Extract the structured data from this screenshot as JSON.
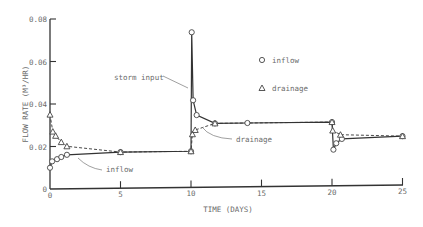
{
  "chart_data": {
    "type": "line",
    "title": "",
    "xlabel": "TIME (DAYS)",
    "ylabel": "FLOW RATE (M³/HR)",
    "xlim": [
      0,
      25
    ],
    "ylim": [
      0,
      0.08
    ],
    "x_ticks": [
      0,
      5,
      10,
      15,
      20,
      25
    ],
    "x_tick_labels": [
      "0",
      "5",
      "10",
      "15",
      "20",
      "25"
    ],
    "y_ticks": [
      0,
      0.02,
      0.04,
      0.06,
      0.08
    ],
    "y_tick_labels": [
      "0",
      "0.02",
      "0.04",
      "0.06",
      "0.08"
    ],
    "grid": false,
    "legend_position": "upper right (inside)",
    "series": [
      {
        "name": "inflow",
        "marker": "circle",
        "line": "solid",
        "x": [
          0,
          0.15,
          0.5,
          0.8,
          1.2,
          5,
          10,
          10.05,
          10.15,
          10.4,
          11.7,
          14,
          20,
          20.1,
          20.3,
          20.7,
          25
        ],
        "y": [
          0.01,
          0.013,
          0.014,
          0.015,
          0.016,
          0.017,
          0.017,
          0.073,
          0.041,
          0.034,
          0.03,
          0.03,
          0.03,
          0.017,
          0.02,
          0.022,
          0.023
        ]
      },
      {
        "name": "drainage",
        "marker": "triangle",
        "line": "dashed",
        "x": [
          0,
          0.2,
          0.4,
          0.8,
          1.2,
          5,
          10,
          10.1,
          10.3,
          11.7,
          20,
          20.05,
          20.6,
          25
        ],
        "y": [
          0.035,
          0.027,
          0.025,
          0.022,
          0.02,
          0.017,
          0.017,
          0.025,
          0.027,
          0.03,
          0.03,
          0.026,
          0.024,
          0.023
        ]
      }
    ],
    "annotations": [
      {
        "text": "storm input",
        "x": 10,
        "y": 0.048
      },
      {
        "text": "drainage",
        "x": 10.5,
        "y": 0.027
      },
      {
        "text": "inflow",
        "x": 1.5,
        "y": 0.015
      }
    ]
  },
  "labels": {
    "xlabel": "TIME (DAYS)",
    "ylabel": "FLOW RATE (M³/HR)",
    "legend_inflow": "inflow",
    "legend_drainage": "drainage",
    "ann_storm": "storm input",
    "ann_drainage": "drainage",
    "ann_inflow": "inflow"
  }
}
